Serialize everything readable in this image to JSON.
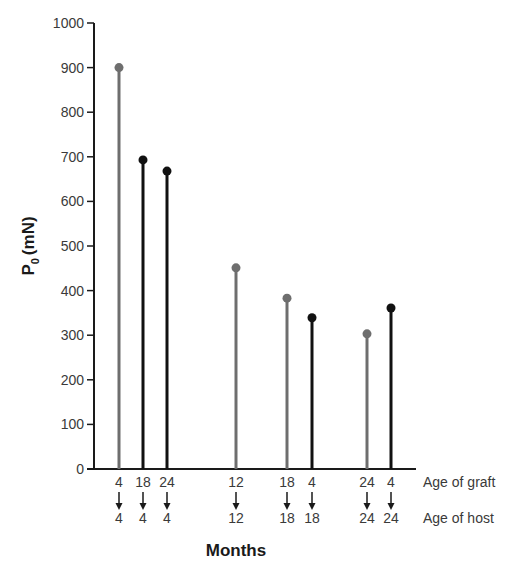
{
  "chart_data": {
    "type": "lollipop",
    "title": "",
    "ylabel": "P0 (mN)",
    "ylabel_main": "P",
    "ylabel_sub": "0",
    "ylabel_unit": "(mN)",
    "xlabel": "Months",
    "ylim": [
      0,
      1000
    ],
    "yticks": [
      0,
      100,
      200,
      300,
      400,
      500,
      600,
      700,
      800,
      900,
      1000
    ],
    "grid": false,
    "row_labels": {
      "graft": "Age of graft",
      "host": "Age of host"
    },
    "colors": {
      "gray": "#6e6e6e",
      "black": "#111111"
    },
    "points": [
      {
        "graft": "4",
        "host": "4",
        "value": 900,
        "color": "gray"
      },
      {
        "graft": "18",
        "host": "4",
        "value": 693,
        "color": "black"
      },
      {
        "graft": "24",
        "host": "4",
        "value": 668,
        "color": "black"
      },
      {
        "graft": "12",
        "host": "12",
        "value": 451,
        "color": "gray"
      },
      {
        "graft": "18",
        "host": "18",
        "value": 383,
        "color": "gray"
      },
      {
        "graft": "4",
        "host": "18",
        "value": 339,
        "color": "black"
      },
      {
        "graft": "24",
        "host": "24",
        "value": 303,
        "color": "gray"
      },
      {
        "graft": "4",
        "host": "24",
        "value": 361,
        "color": "black"
      }
    ]
  }
}
